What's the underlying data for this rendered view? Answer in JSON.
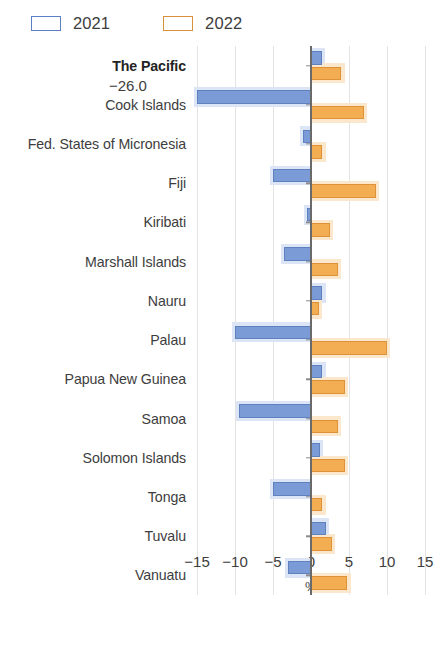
{
  "legend": {
    "items": [
      {
        "label": "2021",
        "color": "#7a9bd6",
        "key": "2021"
      },
      {
        "label": "2022",
        "color": "#f3ad52",
        "key": "2022"
      }
    ]
  },
  "axis": {
    "x_ticks": [
      "−15",
      "−10",
      "−5",
      "0",
      "5",
      "10",
      "15"
    ],
    "x_title": "%"
  },
  "annotations": [
    {
      "text": "−26.0",
      "category": "Cook Islands",
      "series": "2021"
    }
  ],
  "chart_data": {
    "type": "bar",
    "orientation": "horizontal",
    "title": "",
    "xlabel": "%",
    "ylabel": "",
    "xlim": [
      -15,
      15
    ],
    "xticks": [
      -15,
      -10,
      -5,
      0,
      5,
      10,
      15
    ],
    "grid": true,
    "legend_position": "top-left",
    "categories": [
      "The Pacific",
      "Cook Islands",
      "Fed. States of Micronesia",
      "Fiji",
      "Kiribati",
      "Marshall Islands",
      "Nauru",
      "Palau",
      "Papua New Guinea",
      "Samoa",
      "Solomon Islands",
      "Tonga",
      "Tuvalu",
      "Vanuatu"
    ],
    "highlighted_categories": [
      "The Pacific"
    ],
    "series": [
      {
        "name": "2021",
        "color": "#7a9bd6",
        "values": [
          1.4,
          -26.0,
          -1.0,
          -5.0,
          -0.5,
          -3.5,
          1.5,
          -10.0,
          1.5,
          -9.5,
          1.2,
          -5.0,
          2.0,
          -3.0
        ],
        "clipped": [
          false,
          true,
          false,
          false,
          false,
          false,
          false,
          false,
          false,
          false,
          false,
          false,
          false,
          false
        ]
      },
      {
        "name": "2022",
        "color": "#f3ad52",
        "values": [
          4.0,
          7.0,
          1.5,
          8.5,
          2.5,
          3.5,
          1.0,
          10.0,
          4.5,
          3.5,
          4.5,
          1.5,
          2.8,
          4.8
        ],
        "clipped": [
          false,
          false,
          false,
          false,
          false,
          false,
          false,
          false,
          false,
          false,
          false,
          false,
          false,
          false
        ]
      }
    ],
    "data_labels": {
      "Cook Islands": {
        "2021": "−26.0"
      }
    }
  }
}
